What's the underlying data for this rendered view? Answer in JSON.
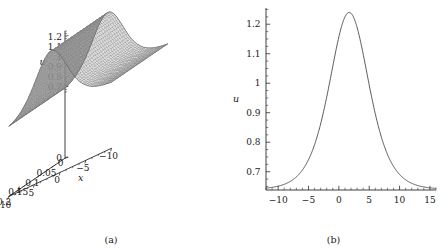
{
  "figure": {
    "panels": [
      {
        "id": "a",
        "caption": "(a)",
        "kind": "surface-3d"
      },
      {
        "id": "b",
        "caption": "(b)",
        "kind": "line-2d"
      }
    ]
  },
  "chart_data": [
    {
      "type": "surface",
      "panel": "a",
      "title": "",
      "xlabel": "x",
      "ylabel": "t",
      "zlabel": "u",
      "xlim": [
        -10,
        10
      ],
      "ylim": [
        0,
        0.2
      ],
      "zlim": [
        0,
        1.25
      ],
      "grid": false,
      "legend": "none",
      "x_ticks": [
        -10,
        -5,
        0,
        5,
        10
      ],
      "x_tick_labels": [
        "-10",
        "-5",
        "0",
        "5",
        "10"
      ],
      "y_ticks": [
        0,
        0.05,
        0.1,
        0.15,
        0.2
      ],
      "y_tick_labels": [
        "0",
        "0.05",
        "0.1",
        "0.15",
        "0.2"
      ],
      "z_ticks": [
        0,
        0.7,
        0.8,
        0.9,
        1,
        1.1,
        1.2
      ],
      "z_tick_labels": [
        "0",
        "0.7",
        "0.8",
        "0.9",
        "1",
        "1.1",
        "1.2"
      ],
      "description": "Mesh surface of a bright soliton ridge u(x,t), crest nearly constant in t, translating slightly with t",
      "surface": {
        "mesh_color": "#808080",
        "face_light": "#d9d9d9",
        "face_dark": "#9a9a9a",
        "peak_value": 1.24,
        "baseline_value": 0.64,
        "peak_x_at_t0": 1.7,
        "peak_x_at_tmax": 1.7
      }
    },
    {
      "type": "line",
      "panel": "b",
      "title": "",
      "xlabel": "x",
      "ylabel": "u",
      "xlim": [
        -12,
        16
      ],
      "ylim": [
        0.638,
        1.255
      ],
      "grid": false,
      "legend": "none",
      "line_color": "#3a3a3a",
      "x_ticks": [
        -10,
        -5,
        0,
        5,
        10,
        15
      ],
      "x_tick_labels": [
        "-10",
        "-5",
        "0",
        "5",
        "10",
        "15"
      ],
      "y_ticks": [
        0.7,
        0.8,
        0.9,
        1.0,
        1.1,
        1.2
      ],
      "y_tick_labels": [
        "0.7",
        "0.8",
        "0.9",
        "1",
        "1.1",
        "1.2"
      ],
      "x": [
        -12,
        -11.5,
        -11,
        -10.5,
        -10,
        -9.5,
        -9,
        -8.5,
        -8,
        -7.5,
        -7,
        -6.5,
        -6,
        -5.5,
        -5,
        -4.5,
        -4,
        -3.5,
        -3,
        -2.5,
        -2,
        -1.5,
        -1,
        -0.5,
        0,
        0.5,
        1,
        1.5,
        1.7,
        2,
        2.5,
        3,
        3.5,
        4,
        4.5,
        5,
        5.5,
        6,
        6.5,
        7,
        7.5,
        8,
        8.5,
        9,
        9.5,
        10,
        10.5,
        11,
        11.5,
        12,
        12.5,
        13,
        13.5,
        14,
        14.5,
        15,
        15.5,
        16
      ],
      "y": [
        0.6443,
        0.6453,
        0.6466,
        0.6482,
        0.6502,
        0.6527,
        0.6558,
        0.6596,
        0.6643,
        0.67,
        0.6769,
        0.6854,
        0.6956,
        0.7079,
        0.7226,
        0.74,
        0.7604,
        0.784,
        0.811,
        0.8412,
        0.8744,
        0.9097,
        0.9458,
        0.981,
        1.0132,
        1.0405,
        1.0612,
        1.0741,
        1.0762,
        1.0748,
        1.0646,
        1.045,
        1.0181,
        0.9861,
        0.9512,
        0.9155,
        0.8806,
        0.8478,
        0.8179,
        0.7914,
        0.7683,
        0.7486,
        0.7319,
        0.718,
        0.7064,
        0.6969,
        0.6891,
        0.6828,
        0.6776,
        0.6734,
        0.67,
        0.6672,
        0.665,
        0.6632,
        0.6617,
        0.6605,
        0.6595,
        0.6587
      ],
      "peak": {
        "x": 1.7,
        "y": 1.2425
      },
      "asymptote": 0.641
    }
  ]
}
